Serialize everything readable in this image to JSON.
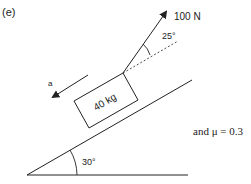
{
  "part_label": "(e)",
  "force": {
    "label": "100 N",
    "angle_to_incline_label": "25°"
  },
  "mass": {
    "label": "40 kg"
  },
  "acceleration": {
    "label": "a"
  },
  "incline": {
    "angle_label": "30°"
  },
  "friction_text": "and μ = 0.3",
  "colors": {
    "stroke": "#222222",
    "background": "#ffffff"
  }
}
